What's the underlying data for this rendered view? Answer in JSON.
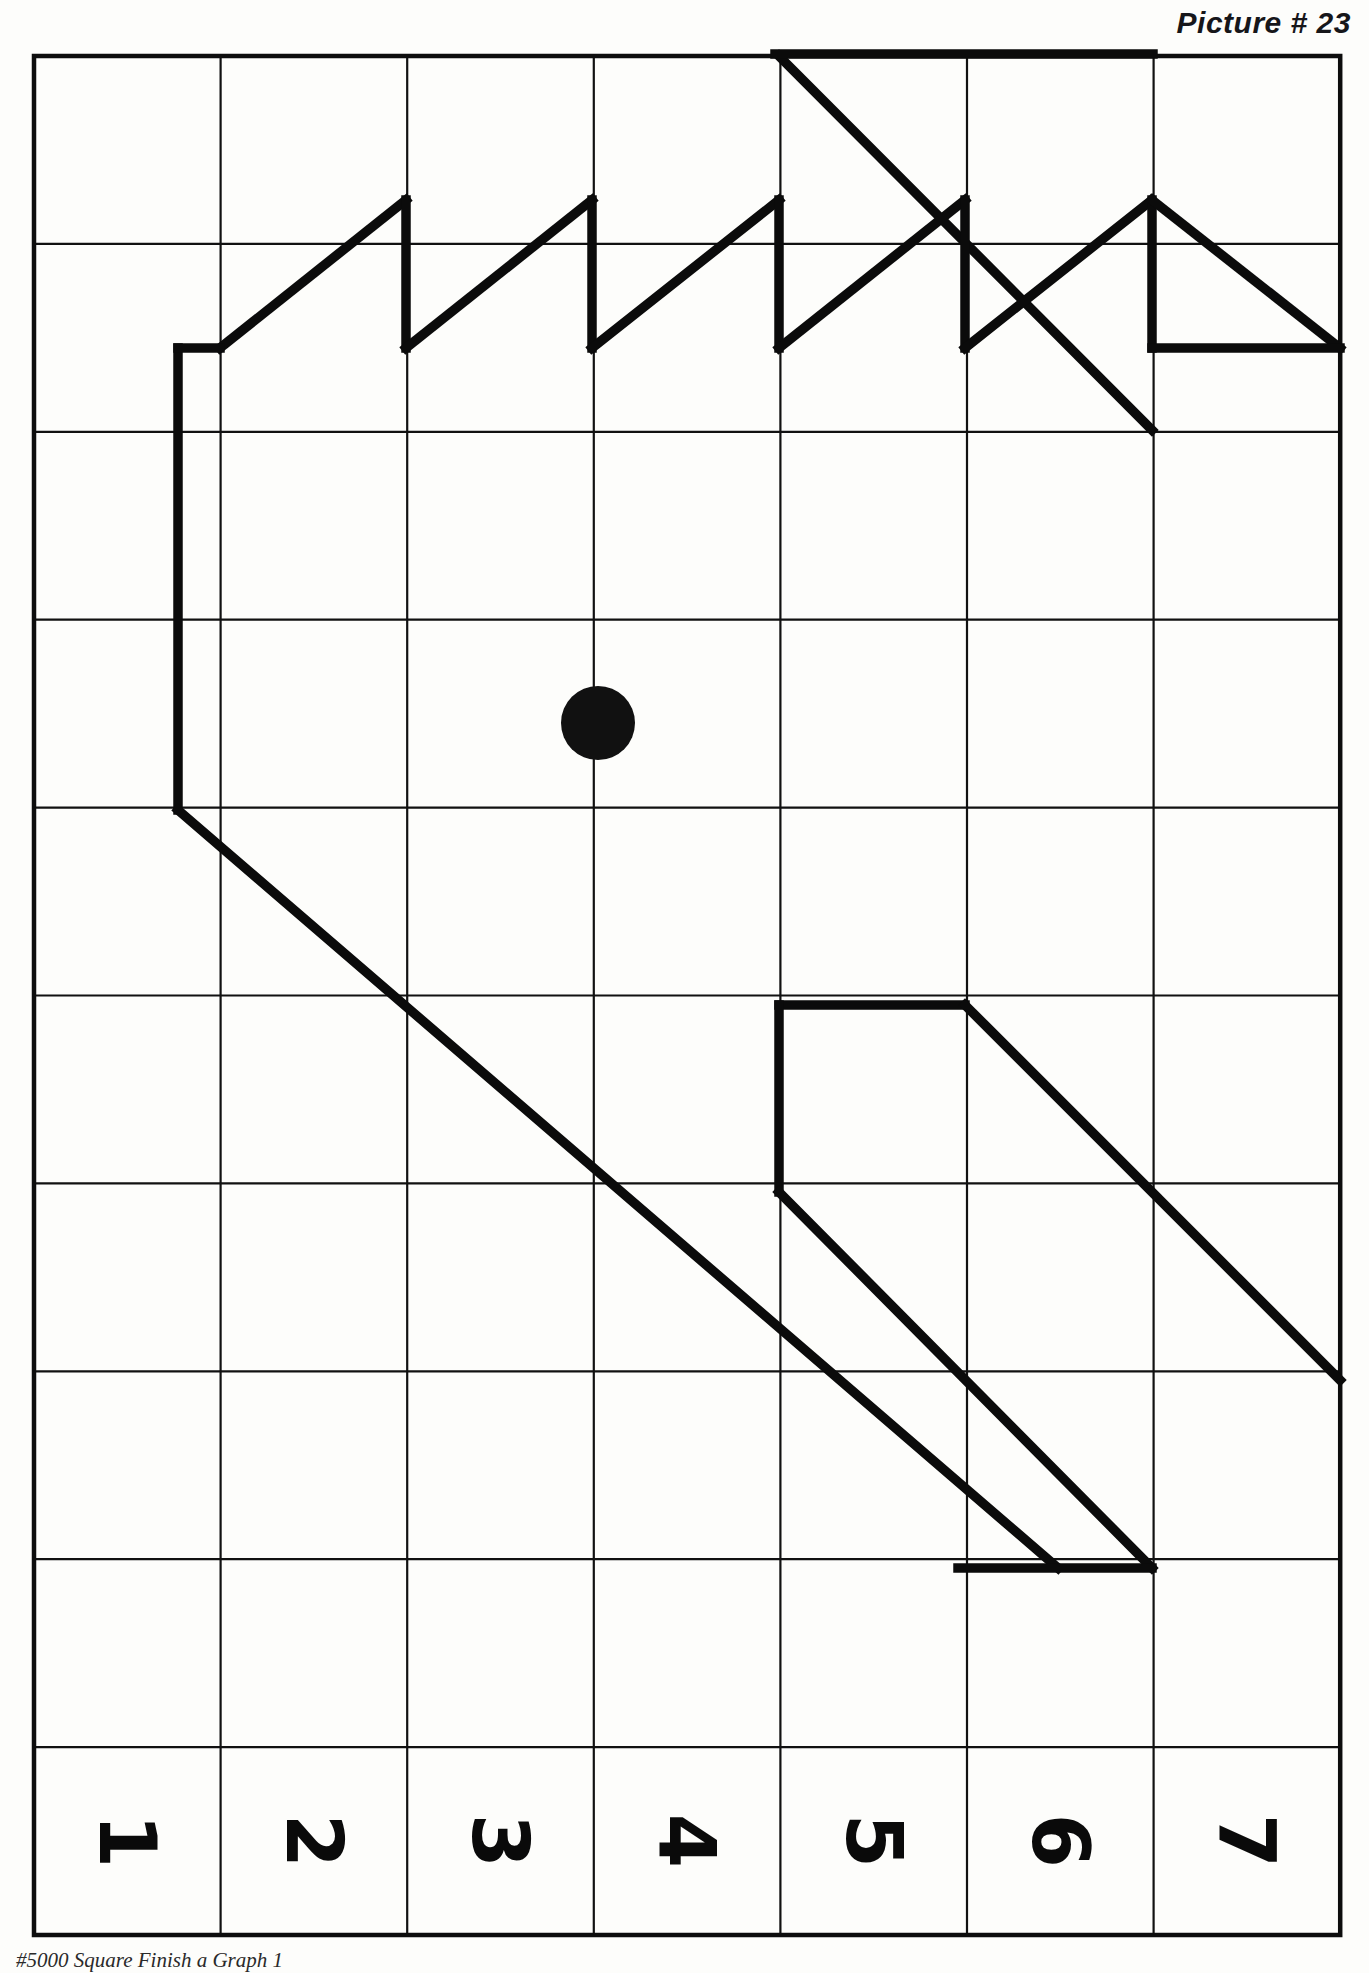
{
  "header": {
    "title": "Picture # 23"
  },
  "footer": {
    "note": "#5000 Square Finish a Graph 1"
  },
  "grid": {
    "columns": 7,
    "rows": 10,
    "left": 34,
    "top": 56,
    "cell_width": 186.6,
    "cell_height": 187.9,
    "line_color": "#111111",
    "border_color": "#0d0d0d"
  },
  "labels": {
    "column_numbers": [
      "1",
      "2",
      "3",
      "4",
      "5",
      "6",
      "7"
    ],
    "rotation_degrees": 90
  },
  "marker": {
    "shape": "filled-circle",
    "color": "#111111",
    "grid_column": 3,
    "grid_row": 4,
    "cx": 598,
    "cy": 723,
    "r": 37
  },
  "drawing": {
    "stroke_color": "#0b0b0b",
    "stroke_width": 9.5,
    "paths": [
      {
        "name": "top-right-ridge",
        "d": "M 779 56 L 1152 430"
      },
      {
        "name": "top-edge-segment",
        "d": "M 775 54 L 1153 54"
      },
      {
        "name": "zigzag-1-rise",
        "d": "M 220 348 L 406 200"
      },
      {
        "name": "zigzag-1-drop",
        "d": "M 406 200 L 406 348"
      },
      {
        "name": "zigzag-2-rise",
        "d": "M 406 348 L 592 200"
      },
      {
        "name": "zigzag-2-drop",
        "d": "M 592 200 L 592 348"
      },
      {
        "name": "zigzag-3-rise",
        "d": "M 592 348 L 779 200"
      },
      {
        "name": "zigzag-3-drop",
        "d": "M 779 200 L 779 348"
      },
      {
        "name": "zigzag-4-rise",
        "d": "M 779 348 L 965 200"
      },
      {
        "name": "zigzag-4-drop",
        "d": "M 965 200 L 965 348"
      },
      {
        "name": "zigzag-5-rise",
        "d": "M 965 348 L 1152 200"
      },
      {
        "name": "peak-vertical",
        "d": "M 1152 200 L 1152 348"
      },
      {
        "name": "peak-descent",
        "d": "M 1152 200 L 1340 348"
      },
      {
        "name": "base-right",
        "d": "M 1152 348 L 1340 348"
      },
      {
        "name": "left-vertical",
        "d": "M 178 348 L 178 810"
      },
      {
        "name": "left-vertical-top-join",
        "d": "M 178 348 L 220 348"
      },
      {
        "name": "long-diagonal",
        "d": "M 178 810 L 1058 1568"
      },
      {
        "name": "upper-parallelogram-top",
        "d": "M 779 1005 L 965 1005"
      },
      {
        "name": "upper-parallelogram-left",
        "d": "M 779 1005 L 779 1192"
      },
      {
        "name": "upper-parallelogram-diag-right",
        "d": "M 965 1005 L 1340 1380"
      },
      {
        "name": "upper-parallelogram-diag-left",
        "d": "M 779 1192 L 1152 1568"
      },
      {
        "name": "lower-parallelogram-base",
        "d": "M 958 1568 L 1152 1568"
      }
    ]
  }
}
